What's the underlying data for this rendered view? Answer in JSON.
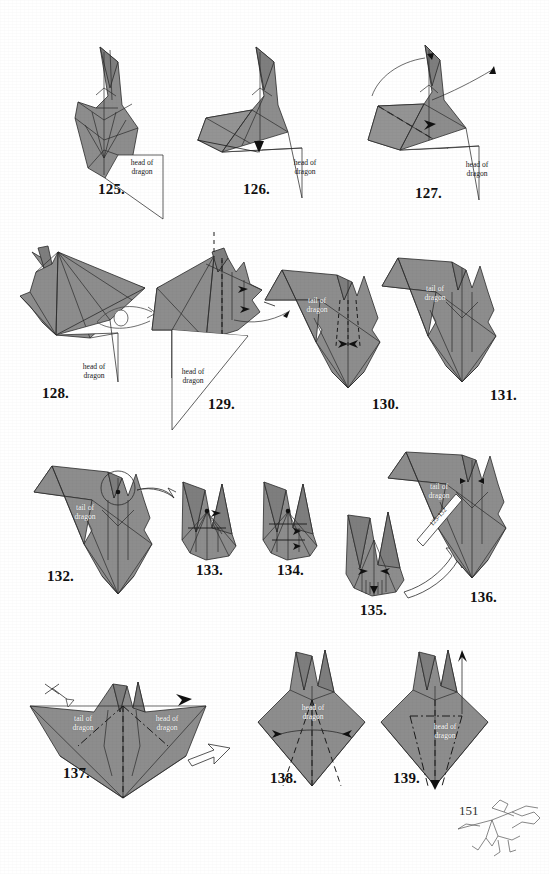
{
  "document": {
    "title": "Origami Dragon Folding Instructions",
    "page_number": "151",
    "paper_fill_color": "#8d8d8d",
    "line_color": "#2b2b2b",
    "background_color": "#ffffff"
  },
  "labels": {
    "head_of_dragon": "head of\ndragon",
    "tail_of_dragon": "tail of\ndragon",
    "repeat_steps": "125-132"
  },
  "steps": [
    {
      "number": "125.",
      "num_x": 98,
      "num_y": 181,
      "callouts": [
        {
          "text_key": "head_of_dragon",
          "x": 121,
          "y": 158,
          "style": "dark"
        }
      ]
    },
    {
      "number": "126.",
      "num_x": 243,
      "num_y": 181,
      "callouts": [
        {
          "text_key": "head_of_dragon",
          "x": 284,
          "y": 158,
          "style": "dark"
        }
      ]
    },
    {
      "number": "127.",
      "num_x": 415,
      "num_y": 185,
      "callouts": [
        {
          "text_key": "head_of_dragon",
          "x": 456,
          "y": 160,
          "style": "dark"
        }
      ]
    },
    {
      "number": "128.",
      "num_x": 42,
      "num_y": 385,
      "callouts": [
        {
          "text_key": "head_of_dragon",
          "x": 73,
          "y": 362,
          "style": "dark"
        }
      ]
    },
    {
      "number": "129.",
      "num_x": 208,
      "num_y": 396,
      "callouts": [
        {
          "text_key": "head_of_dragon",
          "x": 172,
          "y": 367,
          "style": "dark"
        }
      ]
    },
    {
      "number": "130.",
      "num_x": 372,
      "num_y": 396,
      "callouts": [
        {
          "text_key": "tail_of_dragon",
          "x": 303,
          "y": 298,
          "style": "white"
        }
      ]
    },
    {
      "number": "131.",
      "num_x": 490,
      "num_y": 387,
      "callouts": [
        {
          "text_key": "tail_of_dragon",
          "x": 422,
          "y": 284,
          "style": "white"
        }
      ]
    },
    {
      "number": "132.",
      "num_x": 47,
      "num_y": 568,
      "callouts": [
        {
          "text_key": "tail_of_dragon",
          "x": 73,
          "y": 503,
          "style": "white"
        }
      ]
    },
    {
      "number": "133.",
      "num_x": 196,
      "num_y": 562,
      "callouts": []
    },
    {
      "number": "134.",
      "num_x": 277,
      "num_y": 562,
      "callouts": []
    },
    {
      "number": "135.",
      "num_x": 360,
      "num_y": 602,
      "callouts": []
    },
    {
      "number": "136.",
      "num_x": 470,
      "num_y": 589,
      "callouts": [
        {
          "text_key": "tail_of_dragon",
          "x": 425,
          "y": 484,
          "style": "white"
        },
        {
          "text_key": "repeat_steps",
          "x": 430,
          "y": 515,
          "style": "rotated"
        }
      ]
    },
    {
      "number": "137.",
      "num_x": 63,
      "num_y": 765,
      "callouts": [
        {
          "text_key": "tail_of_dragon",
          "x": 70,
          "y": 716,
          "style": "white"
        },
        {
          "text_key": "head_of_dragon",
          "x": 158,
          "y": 716,
          "style": "white"
        }
      ]
    },
    {
      "number": "138.",
      "num_x": 270,
      "num_y": 770,
      "callouts": [
        {
          "text_key": "head_of_dragon",
          "x": 313,
          "y": 707,
          "style": "white"
        }
      ]
    },
    {
      "number": "139.",
      "num_x": 393,
      "num_y": 770,
      "callouts": [
        {
          "text_key": "head_of_dragon",
          "x": 448,
          "y": 724,
          "style": "white"
        }
      ]
    }
  ]
}
